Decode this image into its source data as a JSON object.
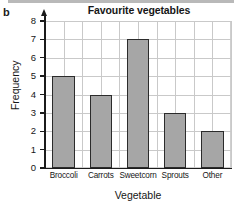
{
  "figure": {
    "part_label": "b",
    "decor": {
      "top_strip": "scan-artifact-strip"
    }
  },
  "chart_data": {
    "type": "bar",
    "title": "Favourite vegetables",
    "xlabel": "Vegetable",
    "ylabel": "Frequency",
    "categories": [
      "Broccoli",
      "Carrots",
      "Sweetcorn",
      "Sprouts",
      "Other"
    ],
    "values": [
      5,
      4,
      7,
      3,
      2
    ],
    "ylim": [
      0,
      8
    ],
    "ytick_labels": [
      "0",
      "1",
      "2",
      "3",
      "4",
      "5",
      "6",
      "7",
      "8"
    ],
    "ytick_values": [
      0,
      1,
      2,
      3,
      4,
      5,
      6,
      7,
      8
    ],
    "grid": true,
    "legend": null,
    "colors": {
      "bar_fill": "#a6a6a6",
      "bar_edge": "#2b2b2b",
      "grid": "#c9c9c9",
      "axis": "#1b1b1b",
      "text": "#161616"
    }
  }
}
